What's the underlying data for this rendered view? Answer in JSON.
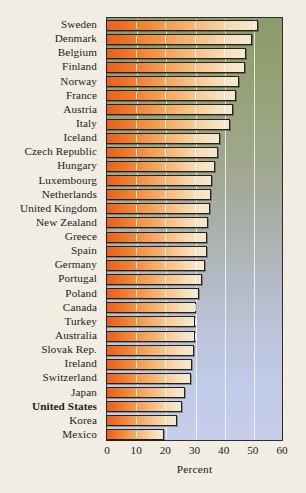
{
  "chart_data": {
    "type": "bar",
    "orientation": "horizontal",
    "title": "",
    "xlabel": "Percent",
    "ylabel": "",
    "xlim": [
      0,
      60
    ],
    "xticks": [
      "0",
      "10",
      "20",
      "30",
      "40",
      "50",
      "60"
    ],
    "grid": "vertical",
    "legend": "none",
    "highlight_category": "United States",
    "categories": [
      "Sweden",
      "Denmark",
      "Belgium",
      "Finland",
      "Norway",
      "France",
      "Austria",
      "Italy",
      "Iceland",
      "Czech Republic",
      "Hungary",
      "Luxembourg",
      "Netherlands",
      "United Kingdom",
      "New Zealand",
      "Greece",
      "Spain",
      "Germany",
      "Portugal",
      "Poland",
      "Canada",
      "Turkey",
      "Australia",
      "Slovak Rep.",
      "Ireland",
      "Switzerland",
      "Japan",
      "United States",
      "Korea",
      "Mexico"
    ],
    "values": [
      52.0,
      50.0,
      48.0,
      47.5,
      45.5,
      44.5,
      43.5,
      42.5,
      39.0,
      38.5,
      37.5,
      36.5,
      36.0,
      35.5,
      35.0,
      34.5,
      34.5,
      34.0,
      33.0,
      32.0,
      31.0,
      30.5,
      30.5,
      30.0,
      29.5,
      29.0,
      27.0,
      26.0,
      24.5,
      20.0
    ]
  },
  "colors": {
    "paper_background": "#f1ede3",
    "plot_top": "#8c9b6b",
    "plot_bottom": "#c5cdea",
    "bar_start": "#e8601f",
    "bar_end": "#f3e8d2",
    "axis": "#2f2f2f",
    "text": "#23201c"
  }
}
